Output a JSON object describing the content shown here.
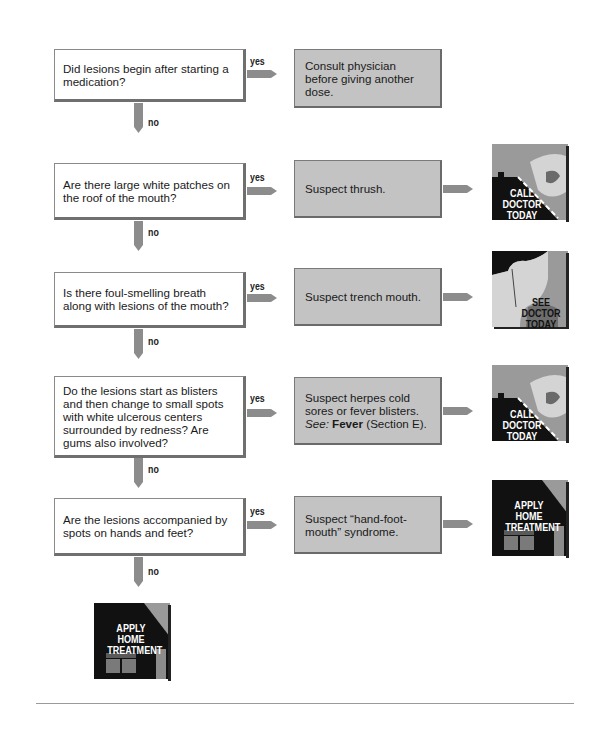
{
  "flowchart": {
    "steps": [
      {
        "question": "Did lesions begin after starting a medication?",
        "yes_label": "yes",
        "no_label": "no",
        "action": "Consult physician before giving another dose.",
        "outcome": null
      },
      {
        "question": "Are there large white patches on the roof of the mouth?",
        "yes_label": "yes",
        "no_label": "no",
        "action": "Suspect thrush.",
        "outcome": {
          "type": "call",
          "lines": [
            "CALL",
            "DOCTOR",
            "TODAY"
          ]
        }
      },
      {
        "question": "Is there foul-smelling breath along with lesions of the mouth?",
        "yes_label": "yes",
        "no_label": "no",
        "action": "Suspect trench mouth.",
        "outcome": {
          "type": "see",
          "lines": [
            "SEE",
            "DOCTOR",
            "TODAY"
          ]
        }
      },
      {
        "question": "Do the lesions start as blisters and then change to small spots with white ulcerous centers surrounded by redness? Are gums also involved?",
        "yes_label": "yes",
        "no_label": "no",
        "action_parts": {
          "text": "Suspect herpes cold sores or fever blisters.",
          "see_label": "See:",
          "see_bold": "Fever",
          "see_rest": "(Section E)."
        },
        "outcome": {
          "type": "call",
          "lines": [
            "CALL",
            "DOCTOR",
            "TODAY"
          ]
        }
      },
      {
        "question": "Are the lesions accompanied by spots on hands and feet?",
        "yes_label": "yes",
        "no_label": "no",
        "action": "Suspect “hand-foot-mouth” syndrome.",
        "outcome": {
          "type": "home",
          "lines": [
            "APPLY",
            "HOME",
            "TREATMENT"
          ]
        }
      }
    ],
    "final_outcome": {
      "type": "home",
      "lines": [
        "APPLY",
        "HOME",
        "TREATMENT"
      ]
    }
  },
  "colors": {
    "answer_box": "#c3c3c3",
    "arrow": "#8c8c8c",
    "icon_dark": "#111111",
    "icon_gray": "#9a9a9a"
  }
}
